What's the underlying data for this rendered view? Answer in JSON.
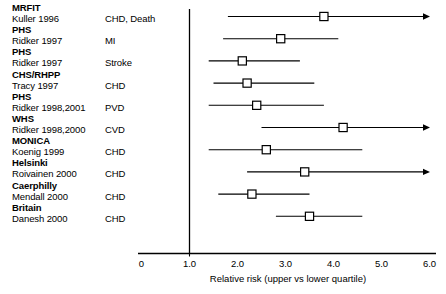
{
  "chart_data": {
    "type": "forest",
    "title": "",
    "xlabel": "Relative risk (upper vs lower quartile)",
    "ylabel": "",
    "xlim": [
      0,
      6.0
    ],
    "xticks": [
      "0",
      "1.0",
      "2.0",
      "3.0",
      "4.0",
      "5.0",
      "6.0"
    ],
    "xtick_values": [
      0,
      1.0,
      2.0,
      3.0,
      4.0,
      5.0,
      6.0
    ],
    "reference_line": 1.0,
    "grid": false,
    "legend": "none",
    "marker": "open-square",
    "studies": [
      {
        "name": "MRFIT",
        "author": "Kuller 1996",
        "outcome": "CHD, Death",
        "rr": 3.8,
        "low": 1.8,
        "high": 6.0,
        "arrow_right": true
      },
      {
        "name": "PHS",
        "author": "Ridker 1997",
        "outcome": "MI",
        "rr": 2.9,
        "low": 1.7,
        "high": 4.1,
        "arrow_right": false
      },
      {
        "name": "PHS",
        "author": "Ridker 1997",
        "outcome": "Stroke",
        "rr": 2.1,
        "low": 1.4,
        "high": 3.3,
        "arrow_right": false
      },
      {
        "name": "CHS/RHPP",
        "author": "Tracy 1997",
        "outcome": "CHD",
        "rr": 2.2,
        "low": 1.5,
        "high": 3.6,
        "arrow_right": false
      },
      {
        "name": "PHS",
        "author": "Ridker 1998,2001",
        "outcome": "PVD",
        "rr": 2.4,
        "low": 1.4,
        "high": 3.8,
        "arrow_right": false
      },
      {
        "name": "WHS",
        "author": "Ridker 1998,2000",
        "outcome": "CVD",
        "rr": 4.2,
        "low": 2.5,
        "high": 6.0,
        "arrow_right": true
      },
      {
        "name": "MONICA",
        "author": "Koenig 1999",
        "outcome": "CHD",
        "rr": 2.6,
        "low": 1.4,
        "high": 4.6,
        "arrow_right": false
      },
      {
        "name": "Helsinki",
        "author": "Roivainen 2000",
        "outcome": "CHD",
        "rr": 3.4,
        "low": 2.2,
        "high": 6.0,
        "arrow_right": true
      },
      {
        "name": "Caerphilly",
        "author": "Mendall 2000",
        "outcome": "CHD",
        "rr": 2.3,
        "low": 1.6,
        "high": 3.5,
        "arrow_right": false
      },
      {
        "name": "Britain",
        "author": "Danesh 2000",
        "outcome": "CHD",
        "rr": 3.5,
        "low": 2.8,
        "high": 4.6,
        "arrow_right": false
      }
    ]
  },
  "colors": {
    "line": "#000000",
    "marker_fill": "#ffffff",
    "axis": "#000000",
    "text": "#000000",
    "background": "#ffffff"
  }
}
